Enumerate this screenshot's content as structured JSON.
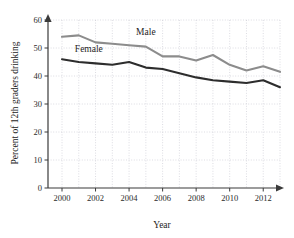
{
  "figure": {
    "background_color": "#ffffff",
    "width": 294,
    "height": 238
  },
  "chart_data": {
    "type": "line",
    "title": "",
    "xlabel": "Year",
    "ylabel": "Percent of 12th graders drinking",
    "x": [
      2000,
      2001,
      2002,
      2003,
      2004,
      2005,
      2006,
      2007,
      2008,
      2009,
      2010,
      2011,
      2012,
      2013
    ],
    "xlim": [
      2000,
      2013
    ],
    "ylim": [
      0,
      60
    ],
    "xticks": [
      2000,
      2002,
      2004,
      2006,
      2008,
      2010,
      2012
    ],
    "xticklabels": [
      "2000",
      "2002",
      "2004",
      "2006",
      "2008",
      "2010",
      "2012"
    ],
    "yticks": [
      0,
      10,
      20,
      30,
      40,
      50,
      60
    ],
    "yticklabels": [
      "0",
      "10",
      "20",
      "30",
      "40",
      "50",
      "60"
    ],
    "grid": true,
    "grid_style": "dotted",
    "grid_color": "#b9b9c4",
    "legend": "inline-annotations",
    "series": [
      {
        "name": "Male",
        "color": "#8c8c8c",
        "line_width": 2.1,
        "label_position": {
          "x": 2005.0,
          "y": 54.5
        },
        "values": [
          54.0,
          54.5,
          52.0,
          51.5,
          51.0,
          50.5,
          47.0,
          47.0,
          45.5,
          47.5,
          44.0,
          42.0,
          43.5,
          41.5
        ]
      },
      {
        "name": "Female",
        "color": "#2d2d2d",
        "line_width": 2.1,
        "label_position": {
          "x": 2001.6,
          "y": 48.6
        },
        "values": [
          46.0,
          45.0,
          44.5,
          44.0,
          45.0,
          43.0,
          42.5,
          41.0,
          39.5,
          38.5,
          38.0,
          37.5,
          38.5,
          36.0
        ]
      }
    ]
  }
}
